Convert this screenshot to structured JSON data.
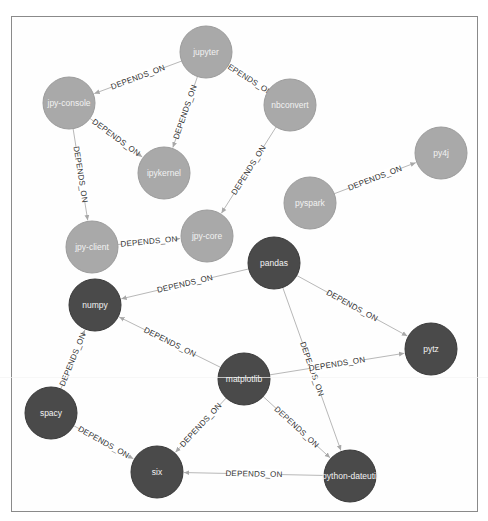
{
  "graph": {
    "title": "Package dependency graph",
    "node_radius": 26,
    "colors": {
      "light_node": "#a9a9a9",
      "dark_node": "#4a4a4a",
      "edge": "#b8b8b8",
      "label_text": "#333333",
      "node_text": "#f2f2f2",
      "frame_border": "#8a8a8a"
    },
    "nodes": [
      {
        "id": "jupyter",
        "label": "jupyter",
        "x": 206,
        "y": 52,
        "shade": "light"
      },
      {
        "id": "jpy-console",
        "label": "jpy-console",
        "x": 69,
        "y": 103,
        "shade": "light"
      },
      {
        "id": "ipykernel",
        "label": "ipykernel",
        "x": 164,
        "y": 173,
        "shade": "light"
      },
      {
        "id": "nbconvert",
        "label": "nbconvert",
        "x": 290,
        "y": 105,
        "shade": "light"
      },
      {
        "id": "py4j",
        "label": "py4j",
        "x": 441,
        "y": 153,
        "shade": "light"
      },
      {
        "id": "pyspark",
        "label": "pyspark",
        "x": 310,
        "y": 203,
        "shade": "light"
      },
      {
        "id": "jpy-client",
        "label": "jpy-client",
        "x": 92,
        "y": 247,
        "shade": "light"
      },
      {
        "id": "jpy-core",
        "label": "jpy-core",
        "x": 207,
        "y": 236,
        "shade": "light"
      },
      {
        "id": "pandas",
        "label": "pandas",
        "x": 274,
        "y": 263,
        "shade": "dark"
      },
      {
        "id": "numpy",
        "label": "numpy",
        "x": 95,
        "y": 305,
        "shade": "dark"
      },
      {
        "id": "pytz",
        "label": "pytz",
        "x": 431,
        "y": 349,
        "shade": "dark"
      },
      {
        "id": "matplotlib",
        "label": "matplotlib",
        "x": 244,
        "y": 379,
        "shade": "dark"
      },
      {
        "id": "spacy",
        "label": "spacy",
        "x": 51,
        "y": 413,
        "shade": "dark"
      },
      {
        "id": "six",
        "label": "six",
        "x": 157,
        "y": 472,
        "shade": "dark"
      },
      {
        "id": "python-dateutil",
        "label": "python-dateutil",
        "x": 350,
        "y": 476,
        "shade": "dark"
      }
    ],
    "edges": [
      {
        "from": "jupyter",
        "to": "jpy-console",
        "label": "DEPENDS_ON"
      },
      {
        "from": "jupyter",
        "to": "ipykernel",
        "label": "DEPENDS_ON"
      },
      {
        "from": "jupyter",
        "to": "nbconvert",
        "label": "DEPENDS_ON"
      },
      {
        "from": "jpy-console",
        "to": "ipykernel",
        "label": "DEPENDS_ON"
      },
      {
        "from": "jpy-console",
        "to": "jpy-client",
        "label": "DEPENDS_ON"
      },
      {
        "from": "nbconvert",
        "to": "jpy-core",
        "label": "DEPENDS_ON"
      },
      {
        "from": "jpy-client",
        "to": "jpy-core",
        "label": "DEPENDS_ON"
      },
      {
        "from": "pyspark",
        "to": "py4j",
        "label": "DEPENDS_ON"
      },
      {
        "from": "pandas",
        "to": "numpy",
        "label": "DEPENDS_ON"
      },
      {
        "from": "pandas",
        "to": "pytz",
        "label": "DEPENDS_ON"
      },
      {
        "from": "pandas",
        "to": "python-dateutil",
        "label": "DEPENDS_ON"
      },
      {
        "from": "matplotlib",
        "to": "numpy",
        "label": "DEPENDS_ON"
      },
      {
        "from": "matplotlib",
        "to": "pytz",
        "label": "DEPENDS_ON"
      },
      {
        "from": "matplotlib",
        "to": "six",
        "label": "DEPENDS_ON"
      },
      {
        "from": "matplotlib",
        "to": "python-dateutil",
        "label": "DEPENDS_ON"
      },
      {
        "from": "spacy",
        "to": "numpy",
        "label": "DEPENDS_ON"
      },
      {
        "from": "spacy",
        "to": "six",
        "label": "DEPENDS_ON"
      },
      {
        "from": "python-dateutil",
        "to": "six",
        "label": "DEPENDS_ON"
      }
    ]
  }
}
